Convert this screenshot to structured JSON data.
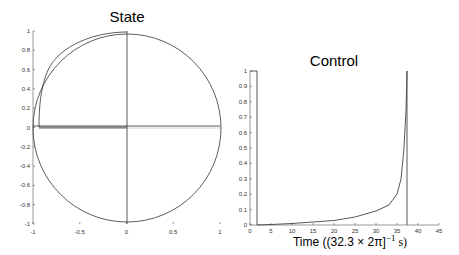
{
  "chart_data": [
    {
      "type": "line",
      "title": "State",
      "xlabel": "",
      "ylabel": "",
      "xlim": [
        -1,
        1
      ],
      "ylim": [
        -1,
        1
      ],
      "grid": false,
      "xticks": [
        "-1",
        "-0.5",
        "0",
        "0.5",
        "1"
      ],
      "yticks": [
        "1",
        "0.8",
        "0.6",
        "0.4",
        "0.2",
        "0",
        "-0.2",
        "-0.4",
        "-0.6",
        "-0.8",
        "-1"
      ],
      "series": [
        {
          "name": "unit circle",
          "description": "reference unit circle x^2 + y^2 = 1"
        },
        {
          "name": "vertical axis line",
          "x": [
            0,
            0
          ],
          "y": [
            -1,
            1
          ]
        },
        {
          "name": "horizontal axis line",
          "x": [
            -1,
            1
          ],
          "y": [
            0,
            0
          ]
        },
        {
          "name": "trajectory",
          "description": "arc from (0,1) along upper-left inside circle down to about (-0.96, 0), then along y=0 toward origin",
          "x": [
            0,
            -0.5,
            -0.8,
            -0.93,
            -0.96,
            -0.96,
            0
          ],
          "y": [
            1,
            0.86,
            0.57,
            0.25,
            0.05,
            -0.01,
            -0.01
          ]
        },
        {
          "name": "dotted segment",
          "x": [
            0,
            1
          ],
          "y": [
            -0.01,
            -0.01
          ],
          "style": "dotted"
        }
      ]
    },
    {
      "type": "line",
      "title": "Control",
      "xlabel": "Time ((32.3 × 2π]⁻¹ s)",
      "ylabel": "",
      "xlim": [
        0,
        45
      ],
      "ylim": [
        0,
        1
      ],
      "grid": false,
      "xticks": [
        "0",
        "5",
        "10",
        "15",
        "20",
        "25",
        "30",
        "35",
        "40",
        "45"
      ],
      "yticks": [
        "1",
        "0.9",
        "0.8",
        "0.7",
        "0.6",
        "0.5",
        "0.4",
        "0.3",
        "0.2",
        "0.1",
        "0"
      ],
      "series": [
        {
          "name": "control",
          "x": [
            0,
            1.5,
            1.5,
            5,
            10,
            15,
            20,
            25,
            30,
            33,
            35,
            36,
            36.8,
            37.3,
            37.5,
            37.5,
            45
          ],
          "y": [
            1,
            1,
            0,
            0.005,
            0.015,
            0.025,
            0.035,
            0.055,
            0.09,
            0.13,
            0.2,
            0.3,
            0.5,
            0.8,
            1.0,
            0,
            0
          ]
        }
      ]
    }
  ],
  "labels": {
    "state_title": "State",
    "control_title": "Control",
    "control_xlabel_prefix": "Time ((32.3 × 2π]",
    "control_xlabel_exp": "−1",
    "control_xlabel_suffix": " s)"
  }
}
